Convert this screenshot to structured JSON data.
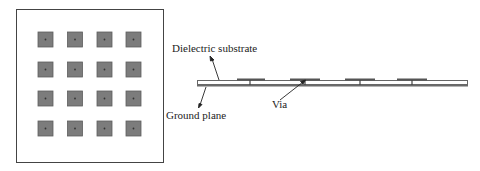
{
  "diagram": {
    "top_view": {
      "name": "top-view",
      "rows": 4,
      "cols": 4,
      "patch_color": "#7a7a7a",
      "patch_border": "#5a5a5a",
      "frame_color": "#444444"
    },
    "side_view": {
      "name": "cross-section",
      "substrate_color": "#ffffff",
      "ground_color": "#6a6a6a",
      "patch_count": 4
    },
    "labels": {
      "dielectric": "Dielectric substrate",
      "ground": "Ground plane",
      "via": "Via"
    }
  }
}
